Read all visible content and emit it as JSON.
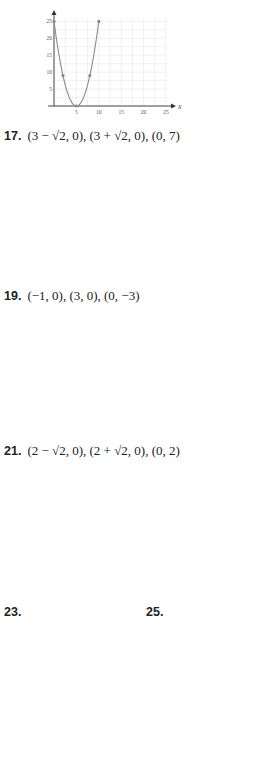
{
  "page": {
    "background": "#ffffff",
    "curve_color": "#8a8a8a",
    "grid_color": "#e6e6e6",
    "axis_color": "#333333"
  },
  "answers": [
    {
      "id": "15",
      "number": "",
      "text": ""
    },
    {
      "id": "17",
      "number": "17.",
      "text": "(3 − √2, 0), (3 + √2, 0), (0, 7)"
    },
    {
      "id": "19",
      "number": "19.",
      "text": "(−1, 0), (3, 0), (0, −3)"
    },
    {
      "id": "21",
      "number": "21.",
      "text": "(2 − √2, 0), (2 + √2, 0), (0, 2)"
    },
    {
      "id": "23",
      "number": "23.",
      "text": ""
    },
    {
      "id": "25",
      "number": "25.",
      "text": ""
    }
  ],
  "chart_data": [
    {
      "type": "line",
      "title": "",
      "xlabel": "x",
      "ylabel": "",
      "xlim": [
        0,
        25
      ],
      "ylim": [
        0,
        26
      ],
      "xticks": [
        5,
        10,
        15,
        20,
        25
      ],
      "yticks": [
        5,
        10,
        15,
        20,
        25
      ],
      "function": "y = (x-5)^2",
      "points": [
        [
          0,
          25
        ],
        [
          2,
          9
        ],
        [
          5,
          0
        ],
        [
          8,
          9
        ],
        [
          10,
          25
        ]
      ],
      "box": {
        "x": 40,
        "y": 8,
        "w": 140,
        "h": 108
      }
    },
    {
      "type": "line",
      "title": "17. (3 − √2, 0), (3 + √2, 0), (0, 7)",
      "xlabel": "x",
      "ylabel": "y",
      "xlim": [
        -3,
        5
      ],
      "ylim": [
        -2,
        9
      ],
      "xticks": [
        -3,
        -2,
        -1,
        1,
        2,
        3,
        4,
        5
      ],
      "yticks": [
        -1,
        1,
        2,
        3,
        4,
        5,
        6,
        7,
        8,
        9
      ],
      "function": "y = x^2 - 6x + 7",
      "points": [
        [
          0,
          7
        ],
        [
          3,
          -2
        ],
        [
          6,
          7
        ]
      ],
      "box": {
        "x": 60,
        "y": 160,
        "w": 140,
        "h": 118
      }
    },
    {
      "type": "line",
      "title": "19. (−1, 0), (3, 0), (0, −3)",
      "xlabel": "x",
      "ylabel": "y",
      "xlim": [
        -5,
        5
      ],
      "ylim": [
        -5,
        6
      ],
      "xticks": [
        -5,
        -4,
        -3,
        -2,
        -1,
        1,
        2,
        3,
        4,
        5
      ],
      "yticks": [
        -5,
        -4,
        -3,
        -2,
        -1,
        1,
        2,
        3,
        4,
        5
      ],
      "function": "y = x^2 - 2x - 3",
      "points": [
        [
          -2,
          5
        ],
        [
          0,
          -3
        ],
        [
          1,
          -4
        ],
        [
          2,
          -3
        ],
        [
          4,
          5
        ]
      ],
      "box": {
        "x": 50,
        "y": 318,
        "w": 150,
        "h": 122
      }
    },
    {
      "type": "line",
      "title": "21. (2 − √2, 0), (2 + √2, 0), (0, 2)",
      "xlabel": "x",
      "ylabel": "y",
      "xlim": [
        -5,
        5
      ],
      "ylim": [
        -5,
        6
      ],
      "xticks": [
        -5,
        -4,
        -3,
        -2,
        -1,
        1,
        2,
        3,
        4,
        5
      ],
      "yticks": [
        -5,
        -4,
        -3,
        -2,
        -1,
        1,
        2,
        3,
        4,
        5
      ],
      "function": "y = x^2 - 4x + 2",
      "points": [
        [
          -0.5,
          4.25
        ],
        [
          0,
          2
        ],
        [
          2,
          -2
        ],
        [
          4,
          2
        ],
        [
          4.5,
          4.25
        ]
      ],
      "box": {
        "x": 50,
        "y": 475,
        "w": 150,
        "h": 122
      }
    },
    {
      "type": "line",
      "title": "23.",
      "xlabel": "x",
      "ylabel": "y",
      "xlim": [
        -5,
        5
      ],
      "ylim": [
        -5,
        6
      ],
      "xticks": [
        -5,
        -4,
        -3,
        -2,
        -1,
        1,
        2,
        3,
        4,
        5
      ],
      "yticks": [
        -5,
        -4,
        -3,
        -2,
        -1,
        1,
        2,
        3,
        4,
        5
      ],
      "function": "y = -x^2 + 4",
      "points": [
        [
          -3,
          -5
        ],
        [
          -1,
          3
        ],
        [
          0,
          4
        ],
        [
          1,
          3
        ],
        [
          3,
          -5
        ]
      ],
      "box": {
        "x": 20,
        "y": 620,
        "w": 110,
        "h": 130
      }
    },
    {
      "type": "line",
      "title": "25.",
      "xlabel": "x",
      "ylabel": "y",
      "xlim": [
        -5,
        5
      ],
      "ylim": [
        -6,
        6
      ],
      "xticks": [
        -5,
        -4,
        -3,
        -2,
        -1,
        1,
        2,
        3,
        4,
        5
      ],
      "yticks": [
        -5,
        -4,
        -3,
        -2,
        -1,
        1,
        2,
        3,
        4,
        5
      ],
      "function": "y = -x^2 - 1",
      "points": [
        [
          -2,
          -5
        ],
        [
          -1,
          -2
        ],
        [
          0,
          -1
        ],
        [
          1,
          -2
        ],
        [
          2,
          -5
        ]
      ],
      "box": {
        "x": 155,
        "y": 620,
        "w": 112,
        "h": 130
      }
    }
  ]
}
